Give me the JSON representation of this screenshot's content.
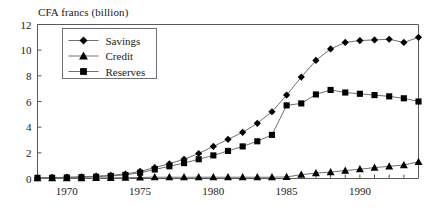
{
  "chart_data": {
    "type": "line",
    "title": "CFA francs (billion)",
    "xlabel": "",
    "ylabel": "CFA francs (billion)",
    "xlim": [
      1968,
      1994
    ],
    "ylim": [
      0,
      12
    ],
    "grid": false,
    "legend_position": "upper-left-inside",
    "y_ticks": [
      0,
      2,
      4,
      6,
      8,
      10,
      12
    ],
    "y_tick_labels": [
      "0",
      "2",
      "4",
      "6",
      "8",
      "10",
      "12"
    ],
    "x_ticks": [
      1968,
      1969,
      1970,
      1971,
      1972,
      1973,
      1974,
      1975,
      1976,
      1977,
      1978,
      1979,
      1980,
      1981,
      1982,
      1983,
      1984,
      1985,
      1986,
      1987,
      1988,
      1989,
      1990,
      1991,
      1992,
      1993,
      1994
    ],
    "x_tick_labels": [
      "1970",
      "1975",
      "1980",
      "1985",
      "1990"
    ],
    "x_labeled_ticks": [
      1970,
      1975,
      1980,
      1985,
      1990
    ],
    "x": [
      1968,
      1969,
      1970,
      1971,
      1972,
      1973,
      1974,
      1975,
      1976,
      1977,
      1978,
      1979,
      1980,
      1981,
      1982,
      1983,
      1984,
      1985,
      1986,
      1987,
      1988,
      1989,
      1990,
      1991,
      1992,
      1993,
      1994
    ],
    "series": [
      {
        "name": "Savings",
        "marker": "diamond",
        "values": [
          0.05,
          0.07,
          0.1,
          0.13,
          0.18,
          0.25,
          0.35,
          0.55,
          0.85,
          1.15,
          1.5,
          1.95,
          2.5,
          3.05,
          3.6,
          4.3,
          5.2,
          6.5,
          7.9,
          9.2,
          10.1,
          10.6,
          10.75,
          10.8,
          10.85,
          10.6,
          11.0
        ]
      },
      {
        "name": "Credit",
        "marker": "triangle",
        "values": [
          0.02,
          0.02,
          0.03,
          0.03,
          0.04,
          0.05,
          0.06,
          0.08,
          0.1,
          0.1,
          0.1,
          0.1,
          0.1,
          0.1,
          0.1,
          0.1,
          0.1,
          0.12,
          0.3,
          0.42,
          0.5,
          0.62,
          0.72,
          0.85,
          0.95,
          1.05,
          1.3
        ]
      },
      {
        "name": "Reserves",
        "marker": "square",
        "values": [
          0.05,
          0.06,
          0.08,
          0.1,
          0.14,
          0.2,
          0.28,
          0.45,
          0.7,
          0.95,
          1.2,
          1.5,
          1.8,
          2.15,
          2.5,
          2.9,
          3.4,
          5.7,
          5.85,
          6.55,
          6.9,
          6.7,
          6.6,
          6.5,
          6.4,
          6.25,
          6.0
        ]
      }
    ]
  },
  "legend": {
    "items": [
      {
        "label": "Savings",
        "marker": "diamond-marker-icon"
      },
      {
        "label": "Credit",
        "marker": "triangle-marker-icon"
      },
      {
        "label": "Reserves",
        "marker": "square-marker-icon"
      }
    ]
  },
  "colors": {
    "marker": "#000000",
    "line": "#6f7073",
    "axis": "#58595b",
    "text": "#1a1a1a",
    "background": "#ffffff"
  }
}
